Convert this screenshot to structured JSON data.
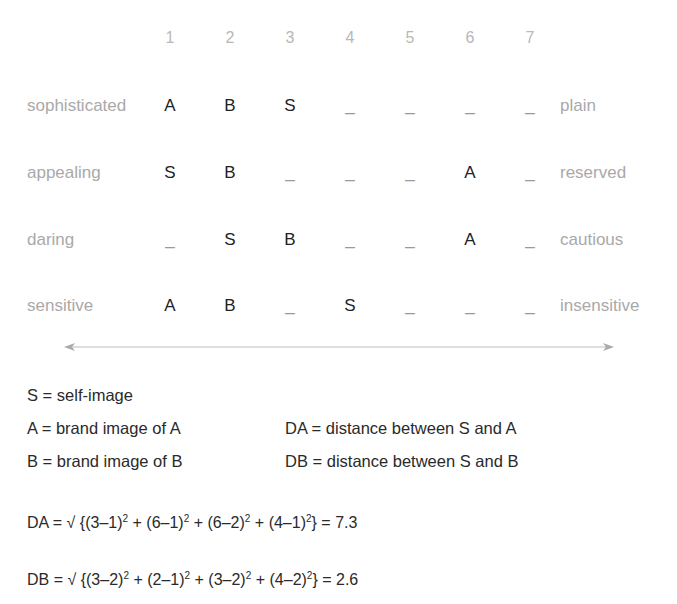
{
  "scale": {
    "columns": [
      "1",
      "2",
      "3",
      "4",
      "5",
      "6",
      "7"
    ],
    "rows": [
      {
        "left": "sophisticated",
        "right": "plain",
        "cells": [
          "A",
          "B",
          "S",
          "_",
          "_",
          "_",
          "_"
        ]
      },
      {
        "left": "appealing",
        "right": "reserved",
        "cells": [
          "S",
          "B",
          "_",
          "_",
          "_",
          "A",
          "_"
        ]
      },
      {
        "left": "daring",
        "right": "cautious",
        "cells": [
          "_",
          "S",
          "B",
          "_",
          "_",
          "A",
          "_"
        ]
      },
      {
        "left": "sensitive",
        "right": "insensitive",
        "cells": [
          "A",
          "B",
          "_",
          "S",
          "_",
          "_",
          "_"
        ]
      }
    ]
  },
  "legend": {
    "s": "S = self-image",
    "a": "A = brand image of A",
    "b": "B = brand image of B",
    "da": "DA = distance between S and A",
    "db": "DB = distance between S and B"
  },
  "formulas": {
    "da": {
      "prefix": "DA = √ {",
      "terms": [
        "(3–1)",
        "(6–1)",
        "(6–2)",
        "(4–1)"
      ],
      "exponent": "2",
      "suffix": "} = 7.3"
    },
    "db": {
      "prefix": "DB = √ {",
      "terms": [
        "(3–2)",
        "(2–1)",
        "(3–2)",
        "(4–2)"
      ],
      "exponent": "2",
      "suffix": "} = 2.6"
    }
  },
  "colors": {
    "trait_label": "#a9a9a9",
    "column_number": "#b8b8b8",
    "mark": "#222222",
    "arrow": "#bdbdbd"
  }
}
